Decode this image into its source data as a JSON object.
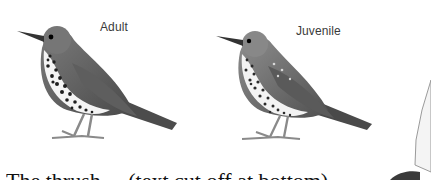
{
  "figures": [
    {
      "label": "Adult",
      "subject": "song thrush adult illustration"
    },
    {
      "label": "Juvenile",
      "subject": "song thrush juvenile illustration"
    }
  ],
  "body_text": {
    "partial_line": "The thrush ... (text cut off at bottom)"
  },
  "colors": {
    "background": "#ffffff",
    "caption": "#3a3a3a",
    "plumage_dark": "#555555",
    "plumage_mid": "#8a8a8a",
    "breast": "#f2f2f2",
    "spots": "#1e1e1e"
  }
}
